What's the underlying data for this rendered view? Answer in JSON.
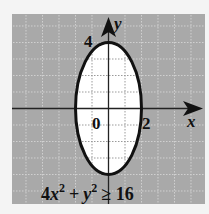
{
  "figure": {
    "inequality": "4x² + y² ≥ 16",
    "inequality_parts": {
      "coef": "4",
      "x": "x",
      "sup1": "2",
      "plus": "+",
      "y": "y",
      "sup2": "2",
      "rel": "≥ 16"
    },
    "axes": {
      "x_label": "x",
      "y_label": "y",
      "origin_label": "0",
      "x_tick_label": "2",
      "y_tick_label": "4"
    },
    "ellipse": {
      "center": [
        0,
        0
      ],
      "semi_axis_x": 2,
      "semi_axis_y": 4
    },
    "shaded_region": "outside ellipse",
    "grid": {
      "range_x": [
        -6,
        6
      ],
      "range_y": [
        -6,
        5
      ],
      "step": 1
    },
    "colors": {
      "shade": "#a9a9a9",
      "interior": "#ffffff",
      "grid_outside": "#d0d0d0",
      "grid_inside": "#9a9a9a",
      "curve": "#111111",
      "background": "#f4f4f4"
    }
  }
}
